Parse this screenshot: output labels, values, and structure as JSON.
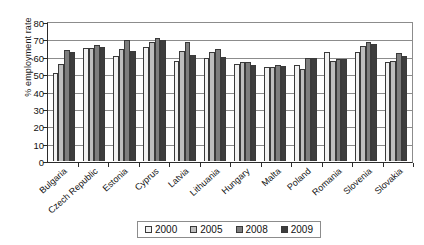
{
  "chart_data": {
    "type": "bar",
    "title": "",
    "xlabel": "",
    "ylabel": "% employment rate",
    "ylim": [
      0,
      80
    ],
    "yticks": [
      0,
      10,
      20,
      30,
      40,
      50,
      60,
      70,
      80
    ],
    "grid": true,
    "legend_position": "bottom",
    "categories": [
      "Bulgaria",
      "Czech Republic",
      "Estonia",
      "Cyprus",
      "Latvia",
      "Lithuania",
      "Hungary",
      "Malta",
      "Poland",
      "Romania",
      "Slovenia",
      "Slovakia"
    ],
    "series": [
      {
        "name": "2000",
        "color": "#f2f2f2",
        "values": [
          50.4,
          65.0,
          60.4,
          65.7,
          57.5,
          59.1,
          56.0,
          54.2,
          55.0,
          63.0,
          62.8,
          56.8
        ]
      },
      {
        "name": "2005",
        "color": "#bdbdbd",
        "values": [
          55.8,
          64.8,
          64.4,
          68.5,
          63.3,
          62.6,
          56.9,
          53.9,
          52.8,
          57.6,
          66.0,
          57.7
        ]
      },
      {
        "name": "2008",
        "color": "#7d7d7d",
        "values": [
          64.0,
          66.6,
          69.8,
          70.9,
          68.6,
          64.3,
          56.7,
          55.2,
          59.2,
          59.0,
          68.6,
          62.3
        ]
      },
      {
        "name": "2009",
        "color": "#3d3d3d",
        "values": [
          62.6,
          65.4,
          63.5,
          69.9,
          60.9,
          60.1,
          55.4,
          54.9,
          59.3,
          58.6,
          67.5,
          60.2
        ]
      }
    ]
  },
  "legend": {
    "items": [
      {
        "label": "2000"
      },
      {
        "label": "2005"
      },
      {
        "label": "2008"
      },
      {
        "label": "2009"
      }
    ]
  }
}
